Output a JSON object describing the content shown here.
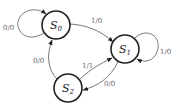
{
  "diagram": {
    "type": "finite-state-machine",
    "states": [
      {
        "id": "S0",
        "letter": "S",
        "sub": "0"
      },
      {
        "id": "S1",
        "letter": "S",
        "sub": "1"
      },
      {
        "id": "S2",
        "letter": "S",
        "sub": "2"
      }
    ],
    "transitions": [
      {
        "from": "S0",
        "to": "S0",
        "in": "0",
        "out": "0",
        "label": "0/0"
      },
      {
        "from": "S0",
        "to": "S1",
        "in": "1",
        "out": "0",
        "label": "1/0"
      },
      {
        "from": "S1",
        "to": "S1",
        "in": "1",
        "out": "0",
        "label": "1/0"
      },
      {
        "from": "S2",
        "to": "S0",
        "in": "0",
        "out": "0",
        "label": "0/0"
      },
      {
        "from": "S2",
        "to": "S1",
        "in": "1",
        "out": "1",
        "label": "1/1"
      },
      {
        "from": "S1",
        "to": "S2",
        "in": "0",
        "out": "0",
        "label": "0/0"
      }
    ]
  }
}
